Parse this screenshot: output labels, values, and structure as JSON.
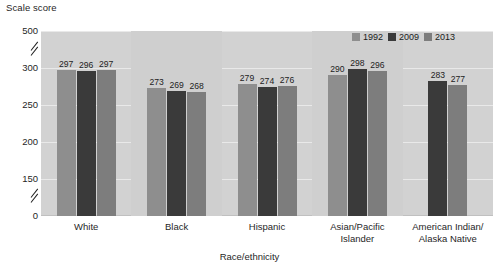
{
  "chart_data": {
    "type": "bar",
    "title": "",
    "ylabel": "Scale score",
    "xlabel": "Race/ethnicity",
    "categories": [
      "White",
      "Black",
      "Hispanic",
      "Asian/Pacific Islander",
      "American Indian/ Alaska Native"
    ],
    "category_lines": [
      [
        "White"
      ],
      [
        "Black"
      ],
      [
        "Hispanic"
      ],
      [
        "Asian/Pacific",
        "Islander"
      ],
      [
        "American Indian/",
        "Alaska Native"
      ]
    ],
    "series": [
      {
        "name": "1992",
        "color": "#8e8e8e",
        "values": [
          297,
          273,
          279,
          290,
          null
        ]
      },
      {
        "name": "2009",
        "color": "#3a3a3a",
        "values": [
          296,
          269,
          274,
          298,
          283
        ]
      },
      {
        "name": "2013",
        "color": "#7d7d7d",
        "values": [
          297,
          268,
          276,
          296,
          277
        ]
      }
    ],
    "ytick_labels": [
      "500",
      "300",
      "250",
      "200",
      "150",
      "0"
    ],
    "ytick_values": [
      500,
      300,
      250,
      200,
      150,
      0
    ],
    "ylim": [
      0,
      500
    ],
    "axis_breaks": [
      {
        "label": "break-upper",
        "between": "300-500"
      },
      {
        "label": "break-lower",
        "between": "0-150"
      }
    ],
    "grid": true,
    "legend_position": "top-right",
    "plot_background": "#d2d2d2"
  },
  "legend": {
    "items": [
      {
        "label": "1992",
        "color": "#8e8e8e"
      },
      {
        "label": "2009",
        "color": "#3a3a3a"
      },
      {
        "label": "2013",
        "color": "#7d7d7d"
      }
    ]
  },
  "axes": {
    "y_title": "Scale score",
    "x_title": "Race/ethnicity"
  }
}
